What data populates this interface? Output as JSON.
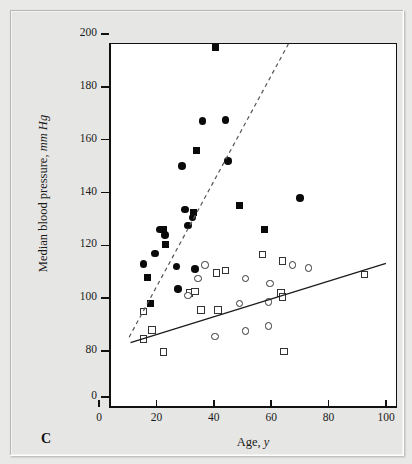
{
  "figure": {
    "panel_label": "C"
  },
  "chart_data": {
    "type": "scatter",
    "title": "",
    "xlabel": "Age, y",
    "ylabel": "Median blood pressure, mm Hg",
    "ylabel_plain": "Median blood pressure, ",
    "ylabel_italic": "mm Hg",
    "xlabel_plain": "Age, ",
    "xlabel_italic": "y",
    "xlim": [
      0,
      100
    ],
    "ylim": [
      0,
      200
    ],
    "y_axis_break": true,
    "y_break_note": "axis compressed between 0 and 80",
    "xticks": [
      0,
      20,
      40,
      60,
      80,
      100
    ],
    "yticks": [
      0,
      80,
      100,
      120,
      140,
      160,
      180,
      200
    ],
    "grid": false,
    "legend": "none",
    "series": [
      {
        "name": "filled-square",
        "marker": "filled square",
        "color": "#0a0a0a",
        "points": [
          {
            "x": 40.5,
            "y": 195
          },
          {
            "x": 34.0,
            "y": 156
          },
          {
            "x": 49.0,
            "y": 135
          },
          {
            "x": 57.5,
            "y": 126
          },
          {
            "x": 33.0,
            "y": 132.5
          },
          {
            "x": 22.5,
            "y": 126
          },
          {
            "x": 23.0,
            "y": 120.5
          },
          {
            "x": 17.0,
            "y": 108
          },
          {
            "x": 18.0,
            "y": 98
          }
        ]
      },
      {
        "name": "filled-circle",
        "marker": "filled circle",
        "color": "#0a0a0a",
        "points": [
          {
            "x": 36.0,
            "y": 167
          },
          {
            "x": 44.0,
            "y": 167.5
          },
          {
            "x": 29.0,
            "y": 150
          },
          {
            "x": 45.0,
            "y": 152
          },
          {
            "x": 70.0,
            "y": 138
          },
          {
            "x": 30.0,
            "y": 133.5
          },
          {
            "x": 32.5,
            "y": 130.5
          },
          {
            "x": 31.0,
            "y": 127.5
          },
          {
            "x": 21.0,
            "y": 126
          },
          {
            "x": 23.0,
            "y": 124
          },
          {
            "x": 19.5,
            "y": 117
          },
          {
            "x": 15.5,
            "y": 113
          },
          {
            "x": 27.0,
            "y": 112
          },
          {
            "x": 33.5,
            "y": 111
          },
          {
            "x": 27.5,
            "y": 103.5
          }
        ]
      },
      {
        "name": "open-square",
        "marker": "open square",
        "color": "#333333",
        "points": [
          {
            "x": 57.0,
            "y": 116.5
          },
          {
            "x": 64.0,
            "y": 114
          },
          {
            "x": 92.5,
            "y": 109
          },
          {
            "x": 44.0,
            "y": 110.5
          },
          {
            "x": 41.0,
            "y": 109.5
          },
          {
            "x": 63.5,
            "y": 102
          },
          {
            "x": 64.0,
            "y": 100.5
          },
          {
            "x": 31.5,
            "y": 102
          },
          {
            "x": 33.5,
            "y": 102.5
          },
          {
            "x": 35.5,
            "y": 95.5
          },
          {
            "x": 41.5,
            "y": 95.5
          },
          {
            "x": 15.5,
            "y": 95
          },
          {
            "x": 18.5,
            "y": 88
          },
          {
            "x": 15.5,
            "y": 84.5
          },
          {
            "x": 22.5,
            "y": 78.5
          },
          {
            "x": 64.5,
            "y": 79
          }
        ]
      },
      {
        "name": "open-circle",
        "marker": "open circle",
        "color": "#333333",
        "points": [
          {
            "x": 37.0,
            "y": 112.5
          },
          {
            "x": 67.5,
            "y": 112.5
          },
          {
            "x": 73.0,
            "y": 111.5
          },
          {
            "x": 34.5,
            "y": 107.5
          },
          {
            "x": 51.0,
            "y": 107.5
          },
          {
            "x": 59.5,
            "y": 105.5
          },
          {
            "x": 49.0,
            "y": 98
          },
          {
            "x": 59.0,
            "y": 98.5
          },
          {
            "x": 31.0,
            "y": 101
          },
          {
            "x": 51.0,
            "y": 87.5
          },
          {
            "x": 59.0,
            "y": 89.5
          },
          {
            "x": 40.5,
            "y": 85.5
          }
        ]
      }
    ],
    "trend_lines": [
      {
        "name": "dashed-regression-line",
        "style": "dashed",
        "color": "#555555",
        "x_start": 7.0,
        "y_start": 89.0,
        "x_end": 62.5,
        "y_end": 200.0
      },
      {
        "name": "solid-regression-line",
        "style": "solid",
        "color": "#1b1b1b",
        "x_start": 7.5,
        "y_start": 87.0,
        "x_end": 96.5,
        "y_end": 117.0
      }
    ]
  }
}
